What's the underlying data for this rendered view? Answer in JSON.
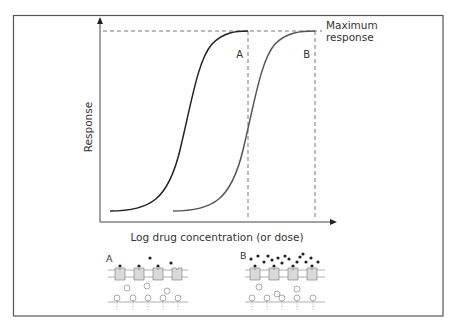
{
  "figure": {
    "y_axis_label": "Response",
    "x_axis_label": "Log drug concentration (or dose)",
    "max_label_line1": "Maximum",
    "max_label_line2": "response",
    "curve_a_label": "A",
    "curve_b_label": "B",
    "panel_a_label": "A",
    "panel_b_label": "B"
  },
  "colors": {
    "frame": "#555555",
    "curve_a": "#222222",
    "curve_b": "#555555",
    "dashes": "#666666",
    "receptor_fill": "#d9d9d9",
    "drug_dot": "#222222"
  }
}
